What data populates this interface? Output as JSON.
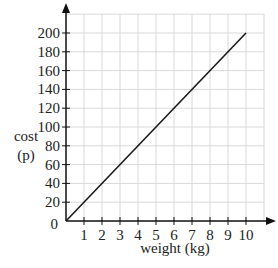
{
  "chart_data": {
    "type": "line",
    "title": "",
    "xlabel": "weight (kg)",
    "ylabel_line1": "cost",
    "ylabel_line2": "(p)",
    "ylabel": "cost (p)",
    "xlim": [
      0,
      10
    ],
    "ylim": [
      0,
      200
    ],
    "grid": true,
    "legend": "none",
    "x_ticks": [
      1,
      2,
      3,
      4,
      5,
      6,
      7,
      8,
      9,
      10
    ],
    "y_ticks": [
      20,
      40,
      60,
      80,
      100,
      120,
      140,
      160,
      180,
      200
    ],
    "origin_label": "0",
    "series": [
      {
        "name": "cost",
        "x": [
          0,
          10
        ],
        "y": [
          0,
          200
        ],
        "color": "#1a1a1a"
      }
    ]
  },
  "colors": {
    "grid": "#d9d9d9",
    "axis": "#111111",
    "line": "#1a1a1a"
  }
}
